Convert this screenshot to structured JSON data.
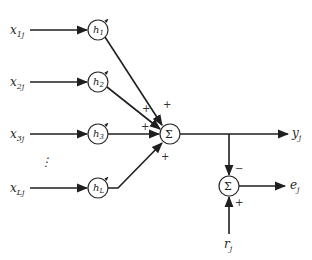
{
  "diagram": {
    "type": "adaptive linear combiner block diagram",
    "inputs": [
      {
        "label": "x",
        "sub": "1j",
        "y": 30
      },
      {
        "label": "x",
        "sub": "2j",
        "y": 82
      },
      {
        "label": "x",
        "sub": "3j",
        "y": 134
      },
      {
        "label": "x",
        "sub": "Lj",
        "y": 188
      }
    ],
    "ellipsis": "⋮",
    "weights": [
      {
        "label": "h",
        "sub": "1"
      },
      {
        "label": "h",
        "sub": "2"
      },
      {
        "label": "h",
        "sub": "3"
      },
      {
        "label": "h",
        "sub": "L"
      }
    ],
    "summer": {
      "symbol": "Σ",
      "signs": [
        "+",
        "+",
        "+",
        "+"
      ]
    },
    "output": {
      "label": "y",
      "sub": "j"
    },
    "error_summer": {
      "symbol": "Σ",
      "minus": "−",
      "plus": "+"
    },
    "error": {
      "label": "e",
      "sub": "j"
    },
    "reference": {
      "label": "r",
      "sub": "j"
    },
    "colors": {
      "line": "#1f1f1f",
      "background": "#ffffff"
    }
  }
}
